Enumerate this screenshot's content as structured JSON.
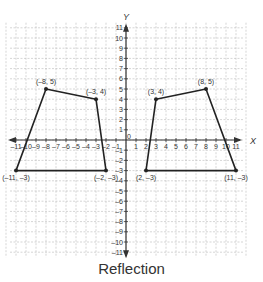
{
  "chart_data": {
    "type": "scatter",
    "title": "",
    "caption": "Reflection",
    "xlabel": "X",
    "ylabel": "Y",
    "xlim": [
      -12,
      12
    ],
    "ylim": [
      -12,
      12
    ],
    "grid": true,
    "x_ticks": [
      -11,
      -10,
      -9,
      -8,
      -7,
      -6,
      -5,
      -4,
      -3,
      -2,
      -1,
      1,
      2,
      3,
      4,
      5,
      6,
      7,
      8,
      9,
      10,
      11
    ],
    "y_ticks": [
      -11,
      -10,
      -9,
      -8,
      -7,
      -6,
      -5,
      -4,
      -3,
      -2,
      -1,
      1,
      2,
      3,
      4,
      5,
      6,
      7,
      8,
      9,
      10,
      11
    ],
    "origin_label": "0",
    "series": [
      {
        "name": "Left trapezoid",
        "closed": true,
        "points": [
          {
            "x": -11,
            "y": -3,
            "label": "(–11, –3)"
          },
          {
            "x": -8,
            "y": 5,
            "label": "(–8, 5)"
          },
          {
            "x": -3,
            "y": 4,
            "label": "(–3, 4)"
          },
          {
            "x": -2,
            "y": -3,
            "label": "(–2, –3)"
          }
        ]
      },
      {
        "name": "Right trapezoid (reflection)",
        "closed": true,
        "points": [
          {
            "x": 2,
            "y": -3,
            "label": "(2, –3)"
          },
          {
            "x": 3,
            "y": 4,
            "label": "(3, 4)"
          },
          {
            "x": 8,
            "y": 5,
            "label": "(8, 5)"
          },
          {
            "x": 11,
            "y": -3,
            "label": "(11, –3)"
          }
        ]
      }
    ]
  },
  "colors": {
    "grid": "#b8b8b8",
    "axis": "#333333",
    "shape": "#222222",
    "text": "#333333"
  }
}
